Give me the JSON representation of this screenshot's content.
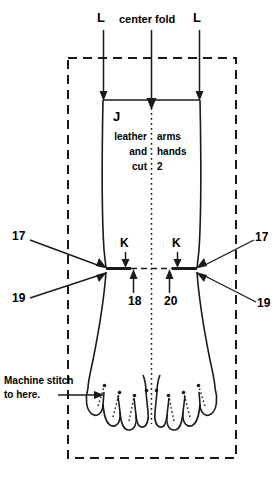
{
  "diagram": {
    "title_labels": {
      "fold_left": "L",
      "fold_center": "center fold",
      "fold_right": "L"
    },
    "pattern_piece": {
      "letter": "J",
      "left_column": [
        "leather",
        "and",
        "cut"
      ],
      "right_column": [
        "arms",
        "hands",
        "2"
      ]
    },
    "notch_labels": {
      "k_left": "K",
      "k_right": "K"
    },
    "callouts": {
      "seventeen_left": "17",
      "seventeen_right": "17",
      "nineteen_left": "19",
      "nineteen_right": "19",
      "eighteen": "18",
      "twenty": "20"
    },
    "instruction": {
      "line1": "Machine stitch",
      "line2": "to here."
    },
    "colors": {
      "ink": "#1a1a1a",
      "paper": "#ffffff"
    }
  }
}
